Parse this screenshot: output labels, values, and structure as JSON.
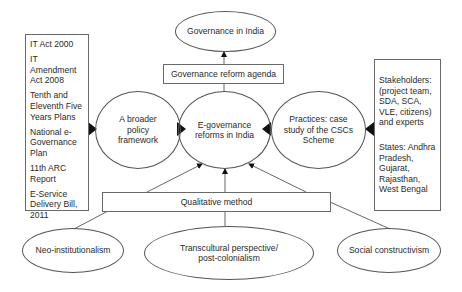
{
  "diagram": {
    "top_node": {
      "label": "Governance in India"
    },
    "agenda_box": {
      "label": "Governance reform agenda"
    },
    "center_node": {
      "label_line1": "E-governance",
      "label_line2": "reforms in India"
    },
    "left_node": {
      "label_line1": "A broader",
      "label_line2": "policy",
      "label_line3": "framework"
    },
    "right_node": {
      "label_line1": "Practices: case",
      "label_line2": "study of the CSCs",
      "label_line3": "Scheme"
    },
    "policy_list": {
      "items": [
        "IT Act 2000",
        "IT Amendment Act 2008",
        "Tenth and Eleventh Five Years Plans",
        "National e-Governance Plan",
        "11th ARC Report",
        "E-Service Delivery Bill, 2011"
      ]
    },
    "practice_list": {
      "items": [
        "Stakeholders: (project team, SDA, SCA, VLE, citizens) and experts",
        "States: Andhra Pradesh, Gujarat, Rajasthan, West Bengal"
      ]
    },
    "method_box": {
      "label": "Qualitative method"
    },
    "theories": [
      {
        "label_line1": "Neo-institutionalism"
      },
      {
        "label_line1": "Transcultural perspective/",
        "label_line2": "post-colonialism"
      },
      {
        "label_line1": "Social constructivism"
      }
    ],
    "colors": {
      "line": "#555555",
      "arrow": "#111111",
      "text": "#2a2a2a",
      "background": "#ffffff"
    }
  }
}
